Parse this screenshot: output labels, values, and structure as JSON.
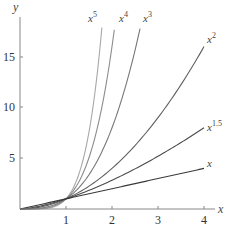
{
  "chart_data": {
    "type": "line",
    "title": "",
    "xlabel": "x",
    "ylabel": "y",
    "xlim": [
      0,
      4.2
    ],
    "ylim": [
      0,
      18.5
    ],
    "x_ticks": [
      1,
      2,
      3,
      4
    ],
    "y_ticks": [
      5,
      10,
      15
    ],
    "grid": false,
    "legend": "inline labels at curve ends",
    "series": [
      {
        "name": "x^5",
        "base": "x",
        "exp": "5",
        "power": 5,
        "x_end": 1.78,
        "color": "#a8a8a8"
      },
      {
        "name": "x^4",
        "base": "x",
        "exp": "4",
        "power": 4,
        "x_end": 2.05,
        "color": "#8c8c8c"
      },
      {
        "name": "x^3",
        "base": "x",
        "exp": "3",
        "power": 3,
        "x_end": 2.61,
        "color": "#777777"
      },
      {
        "name": "x^2",
        "base": "x",
        "exp": "2",
        "power": 2,
        "x_end": 4,
        "color": "#5e5e5e"
      },
      {
        "name": "x^1.5",
        "base": "x",
        "exp": "1.5",
        "power": 1.5,
        "x_end": 4,
        "color": "#4a4a4a"
      },
      {
        "name": "x",
        "base": "x",
        "exp": "",
        "power": 1,
        "x_end": 4,
        "color": "#3a3a3a"
      }
    ]
  },
  "axes": {
    "x_label": "x",
    "y_label": "y",
    "x_tick_labels": [
      "1",
      "2",
      "3",
      "4"
    ],
    "y_tick_labels": [
      "5",
      "10",
      "15"
    ]
  },
  "labels": {
    "x5": {
      "base": "x",
      "exp": "5"
    },
    "x4": {
      "base": "x",
      "exp": "4"
    },
    "x3": {
      "base": "x",
      "exp": "3"
    },
    "x2": {
      "base": "x",
      "exp": "2"
    },
    "x15": {
      "base": "x",
      "exp": "1.5"
    },
    "x1": {
      "base": "x",
      "exp": ""
    }
  }
}
